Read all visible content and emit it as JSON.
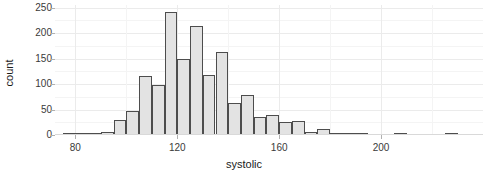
{
  "chart_data": {
    "type": "bar",
    "title": "",
    "subtitle": "",
    "xlabel": "systolic",
    "ylabel": "count",
    "xlim": [
      72,
      240
    ],
    "ylim": [
      0,
      255
    ],
    "x_ticks": [
      80,
      120,
      160,
      200
    ],
    "x_tick_labels": [
      "80",
      "120",
      "160",
      "200"
    ],
    "y_ticks": [
      0,
      50,
      100,
      150,
      200,
      250
    ],
    "y_tick_labels": [
      "0",
      "50",
      "100",
      "150",
      "200",
      "250"
    ],
    "y_minor_ticks": [
      25,
      75,
      125,
      175,
      225
    ],
    "x_minor_ticks": [
      100,
      140,
      180,
      220
    ],
    "grid": true,
    "legend": "none",
    "bin_width": 5,
    "bin_starts": [
      75,
      80,
      85,
      90,
      95,
      100,
      105,
      110,
      115,
      120,
      125,
      130,
      135,
      140,
      145,
      150,
      155,
      160,
      165,
      170,
      175,
      180,
      185,
      190,
      205,
      225
    ],
    "categories": [
      "75-80",
      "80-85",
      "85-90",
      "90-95",
      "95-100",
      "100-105",
      "105-110",
      "110-115",
      "115-120",
      "120-125",
      "125-130",
      "130-135",
      "135-140",
      "140-145",
      "145-150",
      "150-155",
      "155-160",
      "160-165",
      "165-170",
      "170-175",
      "175-180",
      "180-185",
      "185-190",
      "190-195",
      "205-210",
      "225-230"
    ],
    "values": [
      1,
      2,
      4,
      5,
      30,
      48,
      115,
      99,
      242,
      150,
      214,
      117,
      162,
      62,
      79,
      35,
      39,
      25,
      28,
      5,
      12,
      3,
      2,
      1,
      1,
      1
    ],
    "bar_fill_color": "#e3e3e3",
    "bar_border_color": "#4d4d4d",
    "panel_background": "#ffffff",
    "grid_major_color": "#ebebeb",
    "grid_minor_color": "#f4f4f4"
  }
}
